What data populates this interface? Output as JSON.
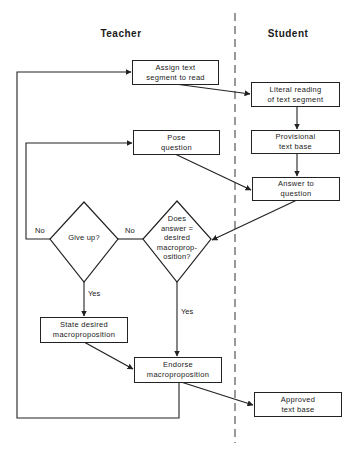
{
  "lanes": {
    "teacher": "Teacher",
    "student": "Student"
  },
  "nodes": {
    "assign": [
      "Assign text",
      "segment to read"
    ],
    "literal": [
      "Literal reading",
      "of text segment"
    ],
    "provisional": [
      "Provisional",
      "text base"
    ],
    "pose": [
      "Pose",
      "question"
    ],
    "answer": [
      "Answer to",
      "question"
    ],
    "give_up": [
      "Give up?"
    ],
    "does_answer": [
      "Does",
      "answer =",
      "desired",
      "macroprop-",
      "osition?"
    ],
    "state": [
      "State desired",
      "macroproposition"
    ],
    "endorse": [
      "Endorse",
      "macroproposition"
    ],
    "approved": [
      "Approved",
      "text base"
    ]
  },
  "edge_labels": {
    "giveup_no": "No",
    "giveup_yes": "Yes",
    "does_no": "No",
    "does_yes": "Yes"
  },
  "colors": {
    "line": "#222222",
    "background": "#ffffff"
  }
}
